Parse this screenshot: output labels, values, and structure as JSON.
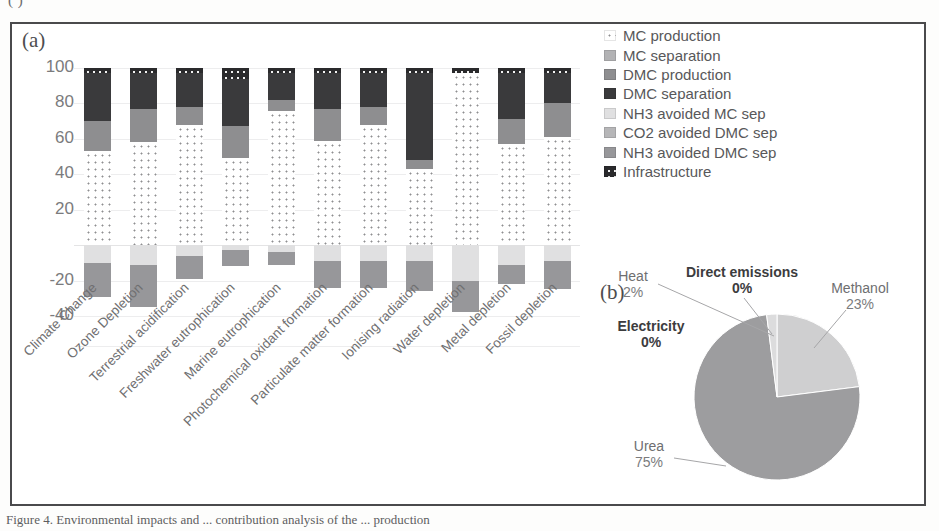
{
  "figure": {
    "clipped_top_text": "(          )",
    "clipped_caption": "Figure 4. Environmental impacts and ... contribution analysis of the ... production",
    "panel_a_tag": "(a)",
    "panel_b_tag": "(b)"
  },
  "chart_data": [
    {
      "type": "bar",
      "title": "",
      "xlabel": "",
      "ylabel": "",
      "stacked": true,
      "grid": true,
      "ylim": [
        -40,
        100
      ],
      "yticks": [
        100,
        80,
        60,
        40,
        20,
        "",
        -20,
        -40
      ],
      "ytick_labels": [
        "100",
        "80",
        "60",
        "40",
        "20",
        "",
        "-20",
        "-40"
      ],
      "legend_position": "right",
      "categories": [
        "Climate Change",
        "Ozone Depletion",
        "Terrestrial acidification",
        "Freshwater eutrophication",
        "Marine eutrophication",
        "Photochemical oxidant formation",
        "Particulate matter formation",
        "Ionising radiation",
        "Water depletion",
        "Metal depletion",
        "Fossil depletion"
      ],
      "series": [
        {
          "name": "MC production",
          "color": "#ffffff",
          "pattern": "dots",
          "values": [
            53,
            58,
            68,
            49,
            76,
            59,
            68,
            43,
            97,
            57,
            61
          ]
        },
        {
          "name": "MC separation",
          "color": "#b2b2b4",
          "values": [
            0,
            0,
            0,
            0,
            0,
            0,
            0,
            0,
            0,
            0,
            0
          ]
        },
        {
          "name": "DMC production",
          "color": "#8e8e90",
          "values": [
            17,
            19,
            10,
            18,
            6,
            18,
            10,
            5,
            0,
            14,
            19
          ]
        },
        {
          "name": "DMC separation",
          "color": "#3a3a3c",
          "values": [
            27,
            20,
            19,
            27,
            15,
            20,
            19,
            49,
            0,
            26,
            17
          ]
        },
        {
          "name": "NH3 avoided MC sep",
          "color": "#e0e0e1",
          "values": [
            -10,
            -11,
            -6,
            -3,
            -4,
            -9,
            -9,
            -9,
            -20,
            -11,
            -9
          ]
        },
        {
          "name": "CO2 avoided DMC sep",
          "color": "#b6b6b8",
          "values": [
            0,
            0,
            0,
            0,
            0,
            0,
            0,
            0,
            0,
            0,
            0
          ]
        },
        {
          "name": "NH3 avoided DMC sep",
          "color": "#97979a",
          "values": [
            -19,
            -24,
            -13,
            -9,
            -7,
            -15,
            -15,
            -17,
            -18,
            -11,
            -16
          ]
        },
        {
          "name": "Infrastructure",
          "color": "#2a2a2c",
          "pattern": "dots",
          "values": [
            3,
            3,
            3,
            6,
            3,
            3,
            3,
            3,
            3,
            3,
            3
          ]
        }
      ]
    },
    {
      "type": "pie",
      "title": "",
      "labels": [
        "Methanol",
        "Urea",
        "Electricity",
        "Heat",
        "Direct emissions"
      ],
      "values": [
        23,
        75,
        0,
        2,
        0
      ],
      "value_labels": [
        "23%",
        "75%",
        "0%",
        "2%",
        "0%"
      ],
      "colors": [
        "#cfcfd0",
        "#9d9d9f",
        "#b8b8ba",
        "#dcdcdd",
        "#e6e6e7"
      ],
      "start_angle_deg": 0
    }
  ],
  "legend": {
    "items": [
      {
        "label": "MC production",
        "swatch": "mcprod"
      },
      {
        "label": "MC separation",
        "swatch": "mcsep"
      },
      {
        "label": "DMC production",
        "swatch": "dmcprod"
      },
      {
        "label": "DMC separation",
        "swatch": "dmcsep"
      },
      {
        "label": "NH3 avoided MC sep",
        "swatch": "nh3mc"
      },
      {
        "label": "CO2 avoided DMC sep",
        "swatch": "co2dmc"
      },
      {
        "label": "NH3 avoided DMC sep",
        "swatch": "nh3dmc"
      },
      {
        "label": "Infrastructure",
        "swatch": "infra"
      }
    ]
  },
  "pie_labels": [
    {
      "id": "heat",
      "name": "Heat",
      "percent": "2%",
      "bold": false
    },
    {
      "id": "direct",
      "name": "Direct emissions",
      "percent": "0%",
      "bold": true
    },
    {
      "id": "methanol",
      "name": "Methanol",
      "percent": "23%",
      "bold": false
    },
    {
      "id": "elec",
      "name": "Electricity",
      "percent": "0%",
      "bold": true
    },
    {
      "id": "urea",
      "name": "Urea",
      "percent": "75%",
      "bold": false
    }
  ]
}
